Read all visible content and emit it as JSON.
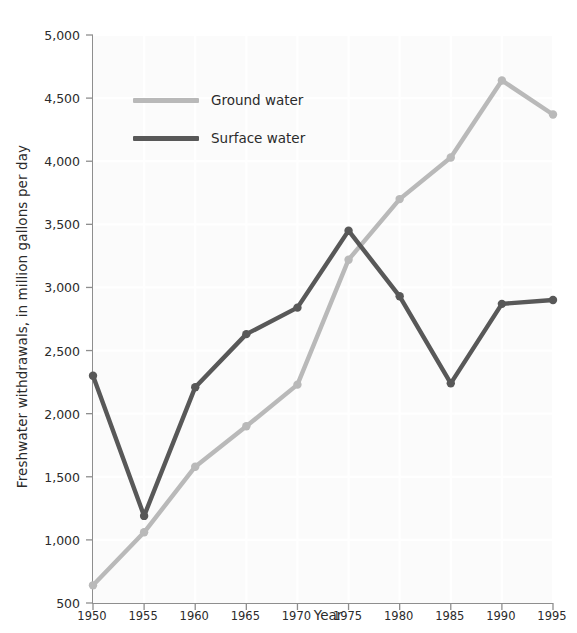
{
  "chart_data": {
    "type": "line",
    "title": "",
    "xlabel": "Year",
    "ylabel": "Freshwater withdrawals, in million gallons per day",
    "x": [
      1950,
      1955,
      1960,
      1965,
      1970,
      1975,
      1980,
      1985,
      1990,
      1995
    ],
    "xtick_labels": [
      "1950",
      "1955",
      "1960",
      "1965",
      "1970",
      "1975",
      "1980",
      "1985",
      "1990",
      "1995"
    ],
    "ytick_labels": [
      "500",
      "1,000",
      "1,500",
      "2,000",
      "2,500",
      "3,000",
      "3,500",
      "4,000",
      "4,500",
      "5,000"
    ],
    "ytick_values": [
      500,
      1000,
      1500,
      2000,
      2500,
      3000,
      3500,
      4000,
      4500,
      5000
    ],
    "xlim": [
      1950,
      1995
    ],
    "ylim": [
      500,
      5000
    ],
    "grid": true,
    "legend_position": "upper-left-inside",
    "series": [
      {
        "name": "Ground water",
        "color": "#b9b9b9",
        "values": [
          640,
          1060,
          1580,
          1900,
          2230,
          3220,
          3700,
          4030,
          4640,
          4370
        ]
      },
      {
        "name": "Surface water",
        "color": "#585858",
        "values": [
          2300,
          1190,
          2210,
          2630,
          2840,
          3450,
          2930,
          2240,
          2870,
          2900
        ]
      }
    ]
  },
  "legend": {
    "entries": [
      {
        "label": "Ground water",
        "color": "#b9b9b9"
      },
      {
        "label": "Surface water",
        "color": "#585858"
      }
    ]
  },
  "colors": {
    "ground_water": "#b9b9b9",
    "surface_water": "#585858",
    "axis": "#8e8e8e",
    "plot_background": "#fbfbfb",
    "gridline": "#ffffff",
    "text": "#2b2b2b"
  }
}
